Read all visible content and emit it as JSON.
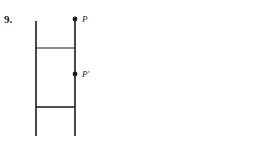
{
  "figure": {
    "problem_number": "9.",
    "background_color": "#ffffff",
    "stroke_color": "#1a1a1a",
    "labels": {
      "point_p": "P",
      "point_p_prime": "P'"
    }
  },
  "chart_data": {
    "type": "diagram",
    "title": "",
    "xlabel": "",
    "ylabel": "",
    "coordinate_space": {
      "width": 266,
      "height": 146,
      "units": "px",
      "origin": "top-left"
    },
    "elements": [
      {
        "name": "left-rail",
        "kind": "line",
        "x1": 36,
        "y1": 21,
        "x2": 36,
        "y2": 136,
        "stroke": "#1a1a1a",
        "stroke_width": 1.6
      },
      {
        "name": "right-rail",
        "kind": "line",
        "x1": 75,
        "y1": 19,
        "x2": 75,
        "y2": 136,
        "stroke": "#1a1a1a",
        "stroke_width": 1.6
      },
      {
        "name": "upper-rung",
        "kind": "line",
        "x1": 36,
        "y1": 48,
        "x2": 75,
        "y2": 48,
        "stroke": "#1a1a1a",
        "stroke_width": 1.2
      },
      {
        "name": "lower-rung",
        "kind": "line",
        "x1": 36,
        "y1": 107,
        "x2": 75,
        "y2": 107,
        "stroke": "#1a1a1a",
        "stroke_width": 1.6
      },
      {
        "name": "point-p",
        "kind": "point",
        "cx": 75,
        "cy": 19,
        "r": 2.4,
        "fill": "#1a1a1a",
        "label": "P",
        "label_x": 82,
        "label_y": 22
      },
      {
        "name": "point-p-prime",
        "kind": "point",
        "cx": 75,
        "cy": 74,
        "r": 2.4,
        "fill": "#1a1a1a",
        "label": "P'",
        "label_x": 82,
        "label_y": 77
      }
    ]
  }
}
